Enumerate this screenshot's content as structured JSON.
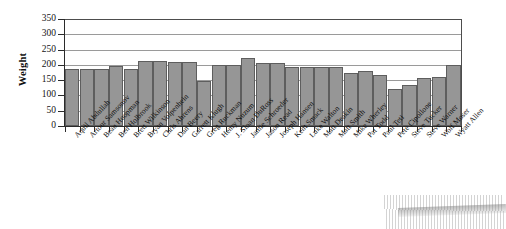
{
  "chart_data": {
    "type": "bar",
    "title": "",
    "xlabel": "",
    "ylabel": "Weight",
    "ylim": [
      0,
      350
    ],
    "ytick_step": 50,
    "yticks": [
      0,
      50,
      100,
      150,
      200,
      250,
      300,
      350
    ],
    "grid": true,
    "grid_axis": "y",
    "legend": "none",
    "bar_color": "#969696",
    "bar_edge_color": "#5e5e5e",
    "categories": [
      "Aquil Abdullah",
      "Artour Samsonov",
      "Beau Hoopman",
      "Ben Holbrook",
      "Brett Wilkinson",
      "Bryan Volpenhein",
      "Chris Ahrens",
      "Dan Beery",
      "Garrett Klugh",
      "Greg Ruckman",
      "Henry Nuzum",
      "J. Sloan DuRoss",
      "Jamie Schroeder",
      "Jason Read",
      "Joseph Hansen",
      "Kent Smack",
      "Luke Walton",
      "Matt Deakin",
      "Matt Smith",
      "Mike Wherley",
      "Pat Todd",
      "Paul Teti",
      "Pete Cipollone",
      "Steve Tucker",
      "Steve Warner",
      "Wolf Moser",
      "Wyatt Allen"
    ],
    "values": [
      185,
      185,
      186,
      196,
      188,
      212,
      212,
      211,
      210,
      148,
      201,
      201,
      222,
      205,
      206,
      192,
      193,
      193,
      194,
      175,
      179,
      166,
      120,
      135,
      157,
      160,
      199
    ],
    "series": [
      {
        "name": "Weight",
        "values": [
          185,
          185,
          186,
          196,
          188,
          212,
          212,
          211,
          210,
          148,
          201,
          201,
          222,
          205,
          206,
          192,
          193,
          193,
          194,
          175,
          179,
          166,
          120,
          135,
          157,
          160,
          199
        ]
      }
    ]
  },
  "axis": {
    "y_title": "Weight"
  }
}
